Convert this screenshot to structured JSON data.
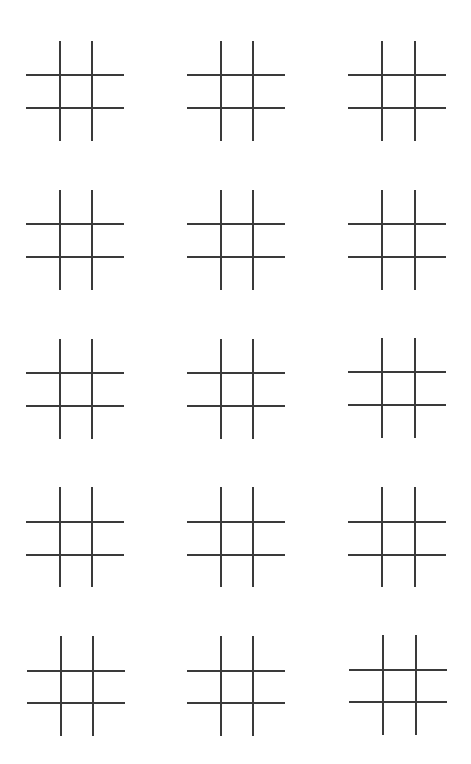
{
  "page": {
    "background": "#ffffff",
    "line_color": "#3a3a3a",
    "rows": 5,
    "cols": 3
  },
  "boards": [
    {
      "row": 0,
      "col": 0,
      "left": 26,
      "top": 41,
      "v": [
        33,
        65
      ],
      "h": [
        33,
        66
      ],
      "cells": [
        "",
        "",
        "",
        "",
        "",
        "",
        "",
        "",
        ""
      ]
    },
    {
      "row": 0,
      "col": 1,
      "left": 187,
      "top": 41,
      "v": [
        33,
        65
      ],
      "h": [
        33,
        66
      ],
      "cells": [
        "",
        "",
        "",
        "",
        "",
        "",
        "",
        "",
        ""
      ]
    },
    {
      "row": 0,
      "col": 2,
      "left": 348,
      "top": 41,
      "v": [
        33,
        66
      ],
      "h": [
        33,
        66
      ],
      "cells": [
        "",
        "",
        "",
        "",
        "",
        "",
        "",
        "",
        ""
      ]
    },
    {
      "row": 1,
      "col": 0,
      "left": 26,
      "top": 190,
      "v": [
        33,
        65
      ],
      "h": [
        33,
        66
      ],
      "cells": [
        "",
        "",
        "",
        "",
        "",
        "",
        "",
        "",
        ""
      ]
    },
    {
      "row": 1,
      "col": 1,
      "left": 187,
      "top": 190,
      "v": [
        33,
        65
      ],
      "h": [
        33,
        66
      ],
      "cells": [
        "",
        "",
        "",
        "",
        "",
        "",
        "",
        "",
        ""
      ]
    },
    {
      "row": 1,
      "col": 2,
      "left": 348,
      "top": 190,
      "v": [
        33,
        66
      ],
      "h": [
        33,
        66
      ],
      "cells": [
        "",
        "",
        "",
        "",
        "",
        "",
        "",
        "",
        ""
      ]
    },
    {
      "row": 2,
      "col": 0,
      "left": 26,
      "top": 339,
      "v": [
        33,
        65
      ],
      "h": [
        33,
        66
      ],
      "cells": [
        "",
        "",
        "",
        "",
        "",
        "",
        "",
        "",
        ""
      ]
    },
    {
      "row": 2,
      "col": 1,
      "left": 187,
      "top": 339,
      "v": [
        33,
        65
      ],
      "h": [
        33,
        66
      ],
      "cells": [
        "",
        "",
        "",
        "",
        "",
        "",
        "",
        "",
        ""
      ]
    },
    {
      "row": 2,
      "col": 2,
      "left": 348,
      "top": 338,
      "v": [
        33,
        66
      ],
      "h": [
        33,
        66
      ],
      "cells": [
        "",
        "",
        "",
        "",
        "",
        "",
        "",
        "",
        ""
      ]
    },
    {
      "row": 3,
      "col": 0,
      "left": 26,
      "top": 487,
      "v": [
        33,
        65
      ],
      "h": [
        34,
        67
      ],
      "cells": [
        "",
        "",
        "",
        "",
        "",
        "",
        "",
        "",
        ""
      ]
    },
    {
      "row": 3,
      "col": 1,
      "left": 187,
      "top": 487,
      "v": [
        33,
        65
      ],
      "h": [
        34,
        67
      ],
      "cells": [
        "",
        "",
        "",
        "",
        "",
        "",
        "",
        "",
        ""
      ]
    },
    {
      "row": 3,
      "col": 2,
      "left": 348,
      "top": 487,
      "v": [
        33,
        66
      ],
      "h": [
        34,
        67
      ],
      "cells": [
        "",
        "",
        "",
        "",
        "",
        "",
        "",
        "",
        ""
      ]
    },
    {
      "row": 4,
      "col": 0,
      "left": 27,
      "top": 636,
      "v": [
        33,
        65
      ],
      "h": [
        34,
        66
      ],
      "cells": [
        "",
        "",
        "",
        "",
        "",
        "",
        "",
        "",
        ""
      ]
    },
    {
      "row": 4,
      "col": 1,
      "left": 187,
      "top": 636,
      "v": [
        33,
        65
      ],
      "h": [
        34,
        66
      ],
      "cells": [
        "",
        "",
        "",
        "",
        "",
        "",
        "",
        "",
        ""
      ]
    },
    {
      "row": 4,
      "col": 2,
      "left": 349,
      "top": 635,
      "v": [
        33,
        66
      ],
      "h": [
        34,
        66
      ],
      "cells": [
        "",
        "",
        "",
        "",
        "",
        "",
        "",
        "",
        ""
      ]
    }
  ]
}
